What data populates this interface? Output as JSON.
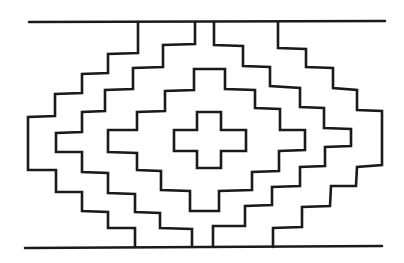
{
  "figure": {
    "title": "Stepped diamond textile motif",
    "kind": "line drawing",
    "stroke_color": "#1a1a1a",
    "background_color": "#ffffff",
    "width": 404,
    "height": 263
  },
  "elements": {
    "top_border": {
      "points": "29,22 385,21"
    },
    "bottom_border": {
      "points": "25,248 382,246"
    },
    "left_outer_step": {
      "points": "138,22 138,53 108,54 108,73 82,74 82,93 55,94 55,116 28,117 28,170 56,170 56,192 82,192 82,211 108,212 108,228 135,228 135,247"
    },
    "left_inner_step": {
      "points": "195,22 195,44 163,45 163,67 133,68 133,89 105,90 105,111 82,112 82,132 56,133 56,152 82,152 82,172 108,173 108,193 135,194 135,212 160,213 160,228 192,229 192,247"
    },
    "right_inner_step": {
      "points": "214,22 214,45 243,46 243,66 270,67 270,86 300,88 300,107 324,108 324,128 351,129 351,146 325,147 325,166 300,167 300,186 272,187 272,205 245,206 245,226 213,226 213,247"
    },
    "right_outer_step": {
      "points": "278,22 278,48 306,49 306,67 333,68 333,88 357,90 357,110 382,111 382,165 357,167 356,186 331,186 330,206 302,207 302,227 273,228 273,247"
    },
    "center_diamond": {
      "points": "194,69 225,69 225,89 255,90 255,108 280,109 280,130 305,130 305,150 279,151 279,171 252,172 252,190 219,191 219,211 190,211 190,191 161,190 161,171 137,170 137,153 108,152 108,130 137,130 137,112 165,111 165,91 194,90"
    },
    "center_cross": {
      "points": "197,112 221,112 221,130 246,130 246,151 221,151 221,168 197,168 197,151 174,151 174,130 197,130"
    }
  }
}
